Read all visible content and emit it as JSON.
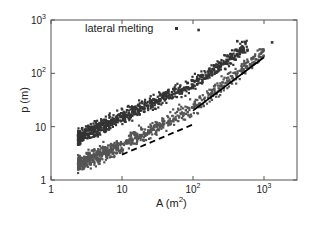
{
  "chart_data": {
    "type": "scatter",
    "title": "",
    "xlabel": "A (m²)",
    "ylabel": "p (m)",
    "xscale": "log",
    "yscale": "log",
    "xlim": [
      1,
      3000
    ],
    "ylim": [
      1,
      1000
    ],
    "grid": false,
    "legend_position": "top-left",
    "x_ticks": [
      {
        "value": 1,
        "label": "1"
      },
      {
        "value": 10,
        "label": "10"
      },
      {
        "value": 100,
        "label": "10",
        "exp": "2"
      },
      {
        "value": 1000,
        "label": "10",
        "exp": "3"
      }
    ],
    "y_ticks": [
      {
        "value": 1,
        "label": "1"
      },
      {
        "value": 10,
        "label": "10"
      },
      {
        "value": 100,
        "label": "10",
        "exp": "2"
      },
      {
        "value": 1000,
        "label": "10",
        "exp": "3"
      }
    ],
    "legend": [
      {
        "label": "lateral melting",
        "marker": "square",
        "color": "#333333"
      }
    ],
    "series": [
      {
        "name": "upper cluster",
        "marker": "square",
        "color": "#333333",
        "trend": {
          "x_range": [
            2.4,
            600
          ],
          "p_at_A": [
            [
              2.4,
              6.3
            ],
            [
              10,
              15
            ],
            [
              100,
              65
            ],
            [
              600,
              330
            ]
          ],
          "spread_log10": 0.12
        }
      },
      {
        "name": "lateral melting (lower cluster)",
        "marker": "square",
        "color": "#555555",
        "trend": {
          "x_range": [
            2.4,
            1000
          ],
          "p_at_A": [
            [
              2.4,
              2.0
            ],
            [
              10,
              4.5
            ],
            [
              100,
              22
            ],
            [
              1000,
              250
            ]
          ],
          "spread_log10": 0.13
        }
      }
    ],
    "reference_lines": [
      {
        "name": "solid slope-1 line",
        "style": "solid",
        "points": [
          [
            100,
            20
          ],
          [
            1000,
            200
          ]
        ],
        "color": "#000000"
      },
      {
        "name": "dashed slope-0.5 line",
        "style": "dashed",
        "points": [
          [
            10,
            3.0
          ],
          [
            100,
            11
          ]
        ],
        "color": "#000000"
      }
    ],
    "annotations": [
      {
        "text": "lateral melting",
        "x": 5.5,
        "y": 650
      }
    ]
  }
}
